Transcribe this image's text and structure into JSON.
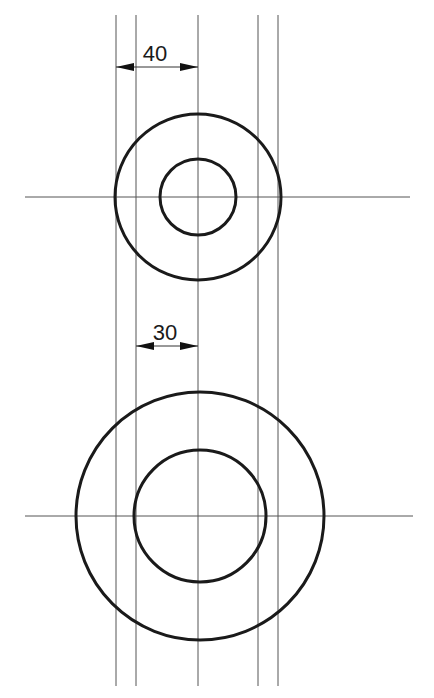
{
  "drawing": {
    "vertical_lines_x": [
      116,
      136,
      198,
      258,
      278
    ],
    "vertical_lines_y_range": [
      15,
      686
    ],
    "top_view": {
      "center": [
        198,
        197
      ],
      "outer_radius": 83,
      "inner_radius": 38,
      "axis_y": 197,
      "axis_x_range": [
        25,
        410
      ]
    },
    "bottom_view": {
      "center": [
        200,
        516
      ],
      "outer_radius": 124,
      "inner_radius": 66,
      "axis_y": 516,
      "axis_x_range": [
        25,
        413
      ]
    },
    "dimensions": [
      {
        "label": "40",
        "from_x": 116,
        "to_x": 198,
        "y": 67
      },
      {
        "label": "30",
        "from_x": 136,
        "to_x": 198,
        "y": 346
      }
    ]
  },
  "colors": {
    "line": "#555555",
    "outline": "#1a1a1a",
    "background": "#ffffff"
  }
}
